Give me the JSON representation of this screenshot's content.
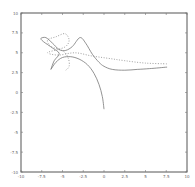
{
  "chart_data": {
    "type": "line",
    "title": "",
    "xlabel": "",
    "ylabel": "",
    "xlim": [
      -10,
      10
    ],
    "ylim": [
      -10,
      10
    ],
    "grid": false,
    "legend": null,
    "x_ticks": [
      "-10",
      "-7.5",
      "-5",
      "-2.5",
      "0",
      "2.5",
      "5",
      "7.5",
      "10"
    ],
    "y_ticks": [
      "10",
      "7.5",
      "5",
      "2.5",
      "0",
      "-2.5",
      "-5",
      "-7.5",
      "-10"
    ],
    "series": [
      {
        "name": "solid-arc",
        "style": "solid",
        "points": [
          [
            -6.4,
            2.9
          ],
          [
            -5.8,
            3.8
          ],
          [
            -5.0,
            4.4
          ],
          [
            -4.0,
            4.5
          ],
          [
            -3.0,
            4.2
          ],
          [
            -2.0,
            3.5
          ],
          [
            -1.2,
            2.4
          ],
          [
            -0.6,
            1.0
          ],
          [
            -0.2,
            -0.5
          ],
          [
            0.0,
            -2.1
          ]
        ]
      },
      {
        "name": "solid-loop-hump",
        "style": "solid",
        "points": [
          [
            -6.4,
            2.9
          ],
          [
            -6.0,
            4.0
          ],
          [
            -5.4,
            4.9
          ],
          [
            -6.2,
            5.6
          ],
          [
            -7.3,
            6.4
          ],
          [
            -7.6,
            6.8
          ],
          [
            -7.0,
            6.9
          ],
          [
            -6.2,
            6.2
          ],
          [
            -5.4,
            5.4
          ],
          [
            -4.6,
            5.3
          ],
          [
            -3.8,
            5.8
          ],
          [
            -2.9,
            6.9
          ],
          [
            -2.2,
            6.2
          ],
          [
            -1.4,
            4.8
          ],
          [
            -0.6,
            3.8
          ],
          [
            0.0,
            3.3
          ],
          [
            1.0,
            2.9
          ],
          [
            2.5,
            2.8
          ],
          [
            4.0,
            2.9
          ],
          [
            5.5,
            3.0
          ],
          [
            7.6,
            3.2
          ]
        ]
      },
      {
        "name": "dotted",
        "style": "dotted",
        "points": [
          [
            -4.6,
            2.8
          ],
          [
            -4.2,
            3.3
          ],
          [
            -4.3,
            4.3
          ],
          [
            -4.9,
            5.2
          ],
          [
            -6.4,
            5.8
          ],
          [
            -6.8,
            6.6
          ],
          [
            -5.8,
            7.0
          ],
          [
            -4.7,
            7.4
          ],
          [
            -4.2,
            6.6
          ],
          [
            -4.6,
            5.8
          ],
          [
            -5.6,
            5.4
          ],
          [
            -6.8,
            5.0
          ],
          [
            -5.5,
            4.7
          ],
          [
            -3.5,
            5.0
          ],
          [
            -1.5,
            4.6
          ],
          [
            0.5,
            4.3
          ],
          [
            2.5,
            4.0
          ],
          [
            5.0,
            3.7
          ],
          [
            7.6,
            3.6
          ]
        ]
      }
    ]
  }
}
